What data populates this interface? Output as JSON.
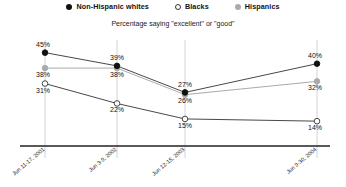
{
  "legend": {
    "items": [
      {
        "label": "Non-Hispanic whites",
        "marker": "filled-black-circle-icon",
        "color": "#111111"
      },
      {
        "label": "Blacks",
        "marker": "open-circle-icon",
        "color": "#ffffff"
      },
      {
        "label": "Hispanics",
        "marker": "filled-gray-circle-icon",
        "color": "#aaaaaa"
      }
    ]
  },
  "subtitle": "Percentage saying \"excellent\" or \"good\"",
  "chart_data": {
    "type": "line",
    "title": "",
    "subtitle": "Percentage saying \"excellent\" or \"good\"",
    "xlabel": "",
    "ylabel": "",
    "ylim": [
      10,
      48
    ],
    "grid": "vertical-only",
    "legend_position": "top-center",
    "categories": [
      "Jun 11-17, 2001",
      "Jun 3-9, 2002",
      "Jun 12-15, 2003",
      "Jun 9-30, 2004"
    ],
    "series": [
      {
        "name": "Non-Hispanic whites",
        "color": "#111111",
        "marker": "filled-circle",
        "values": [
          45,
          39,
          27,
          40
        ],
        "labels": [
          "45%",
          "39%",
          "27%",
          "40%"
        ]
      },
      {
        "name": "Blacks",
        "color": "#ffffff",
        "marker": "open-circle",
        "values": [
          31,
          22,
          15,
          14
        ],
        "labels": [
          "31%",
          "22%",
          "15%",
          "14%"
        ]
      },
      {
        "name": "Hispanics",
        "color": "#aaaaaa",
        "marker": "filled-circle",
        "values": [
          38,
          38,
          26,
          32
        ],
        "labels": [
          "38%",
          "38%",
          "26%",
          "32%"
        ]
      }
    ]
  },
  "axis": {
    "tick_labels": [
      "Jun 11-17, 2001",
      "Jun 3-9, 2002",
      "Jun 12-15, 2003",
      "Jun 9-30, 2004"
    ]
  }
}
